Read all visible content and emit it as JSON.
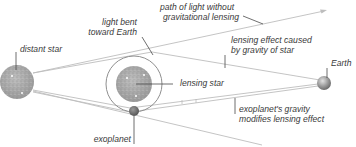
{
  "diagram": {
    "colors": {
      "line": "#b9b9b9",
      "leader": "#4a4a4a",
      "star_fill": "#a9a9a9",
      "ring": "#8f8f8f",
      "exoplanet": "#6e6e6e",
      "earth": "#9a9a9a",
      "text": "#3a3a3a"
    },
    "labels": {
      "distant_star": "distant star",
      "light_bent_line1": "light bent",
      "light_bent_line2": "toward Earth",
      "path_line1": "path of light without",
      "path_line2": "gravitational lensing",
      "lensing_effect_line1": "lensing effect caused",
      "lensing_effect_line2": "by gravity of star",
      "earth": "Earth",
      "lensing_star": "lensing star",
      "exoplanet_gravity_line1": "exoplanet's gravity",
      "exoplanet_gravity_line2": "modifies lensing effect",
      "exoplanet": "exoplanet"
    },
    "objects": [
      {
        "name": "distant star",
        "cx": 17,
        "cy": 82,
        "r": 17
      },
      {
        "name": "lensing star",
        "cx": 134,
        "cy": 84,
        "r": 18
      },
      {
        "name": "lensing ring",
        "cx": 134,
        "cy": 84,
        "r": 28
      },
      {
        "name": "exoplanet",
        "cx": 134,
        "cy": 111,
        "r": 5
      },
      {
        "name": "Earth",
        "cx": 324,
        "cy": 83,
        "r": 7
      }
    ]
  }
}
